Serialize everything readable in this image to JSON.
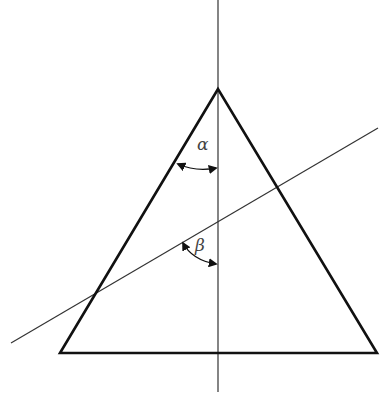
{
  "diagram": {
    "type": "geometry-prism-angles",
    "labels": {
      "alpha": "α",
      "beta": "β"
    },
    "triangle": {
      "apex": [
        218,
        89
      ],
      "bottom_left": [
        60,
        353
      ],
      "bottom_right": [
        377,
        353
      ]
    },
    "vertical_axis": {
      "x": 218,
      "y1": 0,
      "y2": 392
    },
    "oblique_line": {
      "x1": 11,
      "y1": 343,
      "x2": 378,
      "y2": 128
    },
    "colors": {
      "stroke": "#111111",
      "thin_line": "#333333",
      "label": "#444444"
    }
  }
}
